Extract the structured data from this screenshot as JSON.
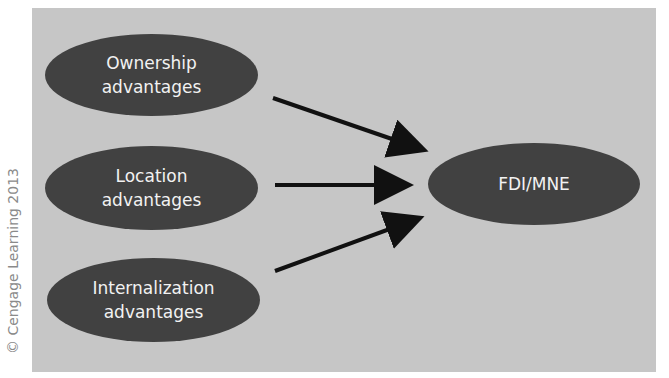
{
  "copyright": "© Cengage Learning 2013",
  "diagram": {
    "type": "flow",
    "inputs": [
      {
        "line1": "Ownership",
        "line2": "advantages"
      },
      {
        "line1": "Location",
        "line2": "advantages"
      },
      {
        "line1": "Internalization",
        "line2": "advantages"
      }
    ],
    "output": {
      "label": "FDI/MNE"
    },
    "edges": [
      {
        "from": "Ownership advantages",
        "to": "FDI/MNE"
      },
      {
        "from": "Location advantages",
        "to": "FDI/MNE"
      },
      {
        "from": "Internalization advantages",
        "to": "FDI/MNE"
      }
    ],
    "colors": {
      "background": "#c6c6c6",
      "node_fill": "#414141",
      "node_text": "#f2f2f2",
      "arrow": "#111111"
    }
  }
}
